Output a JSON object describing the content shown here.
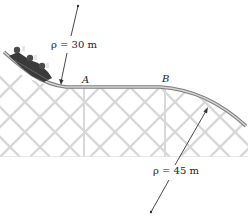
{
  "diagram": {
    "title": "",
    "labels": {
      "radius_top": "ρ = 30 m",
      "radius_bottom": "ρ = 45 m",
      "point_a": "A",
      "point_b": "B"
    },
    "elements": [
      {
        "id": "coaster-car",
        "description": "roller coaster car with riders descending curve"
      },
      {
        "id": "track",
        "description": "track: concave-up curve (ρ = 30 m) to level section A–B, then convex curve (ρ = 45 m)"
      },
      {
        "id": "support-lattice",
        "description": "light grey crisscross support structure"
      },
      {
        "id": "radius-line-top",
        "description": "radius line from center of curvature above to track near A"
      },
      {
        "id": "radius-line-bottom",
        "description": "radius line from center of curvature below to track after B"
      }
    ],
    "colors": {
      "track": "#8a8a8a",
      "lattice": "#d6d6d6",
      "line": "#333333",
      "text": "#222222"
    }
  }
}
